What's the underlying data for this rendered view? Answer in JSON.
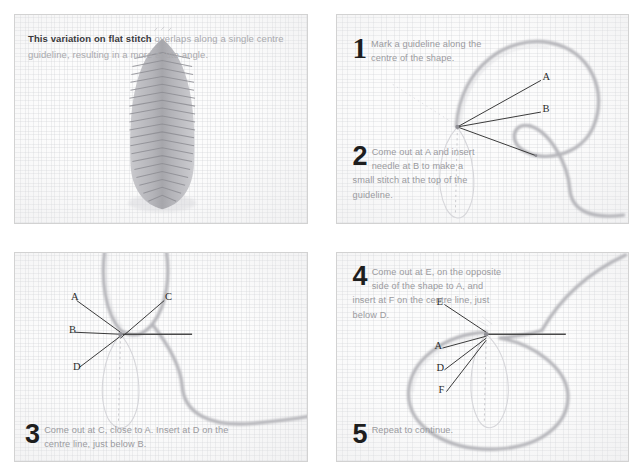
{
  "page": {
    "background_color": "#ffffff",
    "panel_border_color": "#d2d2d2",
    "fabric_color": "#fcfcfc",
    "thread_color": "#b9b9bd",
    "label_color": "#2b2b2b",
    "body_text_color": "#9a9a9e",
    "heading_text_color": "#3a3a3c",
    "number_color": "#1e1e1e"
  },
  "panel1": {
    "intro_bold": "This variation on flat stitch",
    "intro_rest": " overlaps along a single centre guideline, resulting in a more acute angle.",
    "image_caption": "stitched leaf sample"
  },
  "panel2": {
    "steps": [
      {
        "number": "1",
        "text": "Mark a guideline along the centre of the shape."
      },
      {
        "number": "2",
        "text": "Come out at A and insert needle at B to make a small stitch at the top of the guideline."
      }
    ],
    "labels": [
      "A",
      "B"
    ]
  },
  "panel3": {
    "steps": [
      {
        "number": "3",
        "text": "Come out at C, close to A. Insert at D on the centre line, just below B."
      }
    ],
    "labels": [
      "A",
      "B",
      "C",
      "D"
    ]
  },
  "panel4": {
    "steps": [
      {
        "number": "4",
        "text": "Come out at E, on the opposite side of the shape to A, and insert at F on the centre line, just below D."
      },
      {
        "number": "5",
        "text": "Repeat to continue."
      }
    ],
    "labels": [
      "E",
      "A",
      "D",
      "F"
    ]
  }
}
